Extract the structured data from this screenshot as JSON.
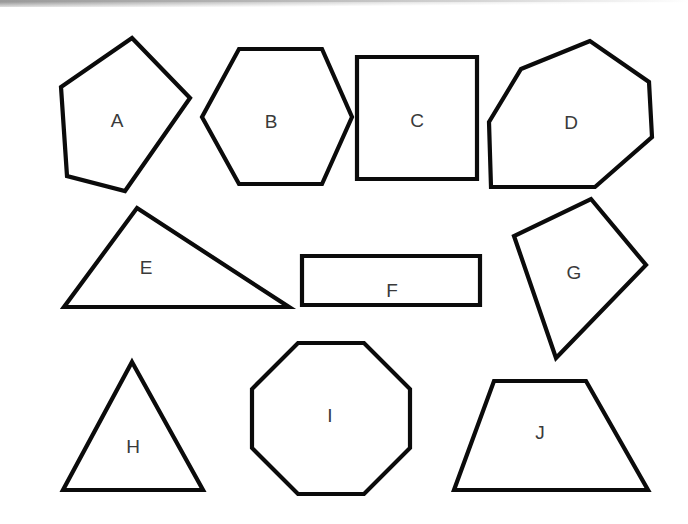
{
  "page": {
    "background_color": "#ffffff",
    "width": 688,
    "height": 524
  },
  "top_band": {
    "name": "scan-edge-gradient-band",
    "start_color": "#9a9a9a",
    "end_color": "#ffffff",
    "height": 7
  },
  "style": {
    "stroke_color": "#0b0b0b",
    "stroke_width": 4.2,
    "fill_color": "#ffffff",
    "label_color": "#3a3a3a",
    "label_font_size": 19
  },
  "shapes": [
    {
      "label": "A",
      "kind": "irregular-pentagon",
      "label_x": 117,
      "label_y": 122,
      "points": "132,38 190,98 125,191 67,176 61,87"
    },
    {
      "label": "B",
      "kind": "hexagon",
      "label_x": 271,
      "label_y": 123,
      "points": "239,49 322,49 352,117 322,184 239,184 202,117"
    },
    {
      "label": "C",
      "kind": "square",
      "label_x": 417,
      "label_y": 122,
      "points": "357,57 477,57 477,179 357,179"
    },
    {
      "label": "D",
      "kind": "irregular-heptagon",
      "label_x": 571,
      "label_y": 124,
      "points": "590,41 521,69 489,122 491,187 595,187 652,137 649,82"
    },
    {
      "label": "E",
      "kind": "scalene-triangle",
      "label_x": 146,
      "label_y": 269,
      "points": "137,208 289,307 64,307"
    },
    {
      "label": "F",
      "kind": "rectangle",
      "label_x": 392,
      "label_y": 292,
      "points": "302,256 480,256 480,305 302,305"
    },
    {
      "label": "G",
      "kind": "kite",
      "label_x": 574,
      "label_y": 274,
      "points": "591,199 646,265 556,358 514,236"
    },
    {
      "label": "H",
      "kind": "isosceles-triangle",
      "label_x": 133,
      "label_y": 448,
      "points": "132,362 203,490 63,490"
    },
    {
      "label": "I",
      "kind": "octagon",
      "label_x": 330,
      "label_y": 417,
      "points": "298,343 364,343 410,389 410,448 364,494 298,494 252,448 252,389"
    },
    {
      "label": "J",
      "kind": "trapezoid",
      "label_x": 540,
      "label_y": 434,
      "points": "494,381 586,381 648,490 454,490"
    }
  ]
}
